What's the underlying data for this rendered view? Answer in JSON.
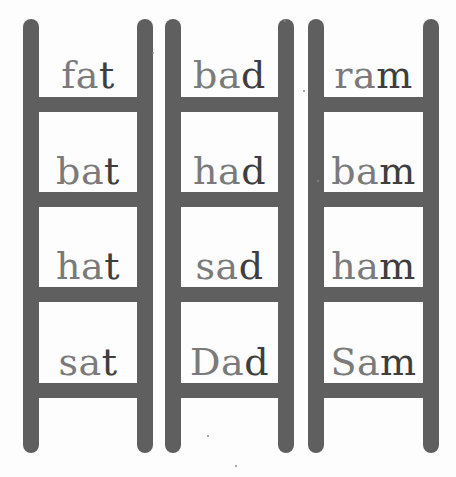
{
  "colors": {
    "ladder": "#5f5f5f",
    "onset_text": "#7a7a7a",
    "final_text": "#3e3e3e",
    "background": "#fdfdfd"
  },
  "ladders": [
    {
      "family": "-at",
      "words": [
        {
          "word": "fat",
          "onset": "fa",
          "final": "t"
        },
        {
          "word": "bat",
          "onset": "ba",
          "final": "t"
        },
        {
          "word": "hat",
          "onset": "ha",
          "final": "t"
        },
        {
          "word": "sat",
          "onset": "sa",
          "final": "t"
        }
      ]
    },
    {
      "family": "-ad",
      "words": [
        {
          "word": "bad",
          "onset": "ba",
          "final": "d"
        },
        {
          "word": "had",
          "onset": "ha",
          "final": "d"
        },
        {
          "word": "sad",
          "onset": "sa",
          "final": "d"
        },
        {
          "word": "Dad",
          "onset": "Da",
          "final": "d"
        }
      ]
    },
    {
      "family": "-am",
      "words": [
        {
          "word": "ram",
          "onset": "ra",
          "final": "m"
        },
        {
          "word": "bam",
          "onset": "ba",
          "final": "m"
        },
        {
          "word": "ham",
          "onset": "ha",
          "final": "m"
        },
        {
          "word": "Sam",
          "onset": "Sa",
          "final": "m"
        }
      ]
    }
  ]
}
